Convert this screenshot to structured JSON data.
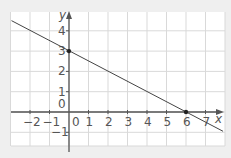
{
  "chart_data": {
    "type": "line",
    "title": "",
    "xlabel": "x",
    "ylabel": "y",
    "xlim": [
      -3,
      8
    ],
    "ylim": [
      -1.7,
      5
    ],
    "grid": true,
    "x_ticks": [
      -2,
      -1,
      0,
      1,
      2,
      3,
      4,
      5,
      6,
      7
    ],
    "y_ticks": [
      -1,
      0,
      1,
      2,
      3,
      4
    ],
    "x_tick_labels": [
      "−2",
      "−1",
      "0",
      "1",
      "2",
      "3",
      "4",
      "5",
      "6",
      "7"
    ],
    "y_tick_labels": [
      "−1",
      "0",
      "1",
      "2",
      "3",
      "4"
    ],
    "series": [
      {
        "name": "line",
        "equation": "y = 3 - x/2",
        "x": [
          -3,
          8
        ],
        "y": [
          4.5,
          -1
        ],
        "color": "#444444"
      }
    ],
    "points": [
      {
        "x": 0,
        "y": 3,
        "label": "y-intercept"
      },
      {
        "x": 6,
        "y": 0,
        "label": "x-intercept"
      }
    ],
    "colors": {
      "grid": "#d9d9d9",
      "axis": "#555555",
      "line": "#444444",
      "panel": "#ffffff",
      "background": "#efefef"
    }
  }
}
